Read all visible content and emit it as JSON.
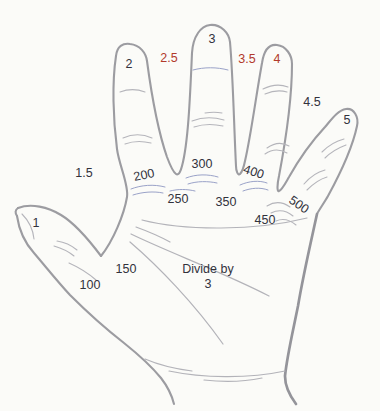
{
  "colors": {
    "background": "#fbfbf8",
    "outline_gray": "#9c9ca1",
    "outline_gray_thick": "#94949a",
    "crease_gray": "#b5b5bb",
    "crease_blue": "#9aa2c8",
    "label_dark": "#32323c",
    "label_red": "#b23a2c"
  },
  "labels": {
    "fingertips": [
      {
        "id": "thumb",
        "text": "1",
        "color": "dark"
      },
      {
        "id": "thumb-index-web",
        "text": "1.5",
        "color": "dark"
      },
      {
        "id": "index-finger",
        "text": "2",
        "color": "dark"
      },
      {
        "id": "index-middle-web",
        "text": "2.5",
        "color": "red"
      },
      {
        "id": "middle-finger",
        "text": "3",
        "color": "dark"
      },
      {
        "id": "middle-ring-web",
        "text": "3.5",
        "color": "red"
      },
      {
        "id": "ring-finger",
        "text": "4",
        "color": "red"
      },
      {
        "id": "ring-little-web",
        "text": "4.5",
        "color": "dark"
      },
      {
        "id": "little-finger",
        "text": "5",
        "color": "dark"
      }
    ],
    "base_values": [
      {
        "id": "thumb-base",
        "text": "100"
      },
      {
        "id": "thumb-web-base",
        "text": "150"
      },
      {
        "id": "index-base",
        "text": "200"
      },
      {
        "id": "index-middle-base",
        "text": "250"
      },
      {
        "id": "middle-base",
        "text": "300"
      },
      {
        "id": "middle-ring-base",
        "text": "350"
      },
      {
        "id": "ring-base",
        "text": "400"
      },
      {
        "id": "ring-little-base",
        "text": "450"
      },
      {
        "id": "little-base",
        "text": "500"
      }
    ],
    "instruction": {
      "line1": "Divide by",
      "line2": "3"
    }
  }
}
